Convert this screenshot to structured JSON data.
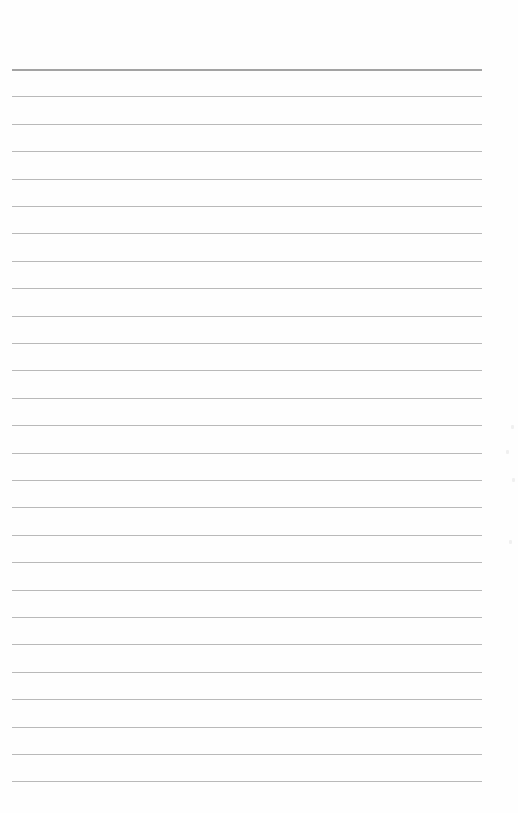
{
  "page": {
    "type": "lined-paper",
    "background_color": "#fefefe",
    "rule_color": "#b9b9b9",
    "top_rule_color": "#a3a3a3",
    "line_count": 27,
    "first_line_y": 69,
    "line_spacing": 27.4,
    "line_left": 12,
    "line_width": 470,
    "text": ""
  }
}
